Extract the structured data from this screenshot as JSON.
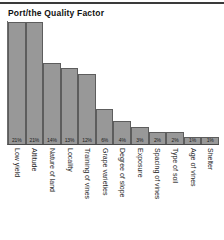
{
  "chart": {
    "title": "Port/the Quality Factor"
  },
  "chart_data": {
    "type": "bar",
    "title": "Port/the Quality Factor",
    "xlabel": "",
    "ylabel": "",
    "ylim": [
      0,
      21
    ],
    "grid": false,
    "legend": false,
    "orientation": "vertical",
    "value_label_position": "inside-bottom",
    "category_label_rotation": 90,
    "categories": [
      "Low yield",
      "Altitude",
      "Nature of land",
      "Locality",
      "Training of vines",
      "Grape varieties",
      "Degree of slope",
      "Exposure",
      "Spacing of vines",
      "Type of soil",
      "Age of vines",
      "Shelter"
    ],
    "values": [
      21,
      21,
      14,
      13,
      12,
      6,
      4,
      3,
      2,
      2,
      1,
      1
    ],
    "value_labels": [
      "21%",
      "21%",
      "14%",
      "13%",
      "12%",
      "6%",
      "4%",
      "3%",
      "2%",
      "2%",
      "1%",
      "1%"
    ],
    "colors": {
      "bar_fill": "#989898",
      "bar_edge": "#5d5d5d",
      "axis": "#4a4a4a",
      "text": "#1c1c1c",
      "background": "#ffffff"
    }
  }
}
